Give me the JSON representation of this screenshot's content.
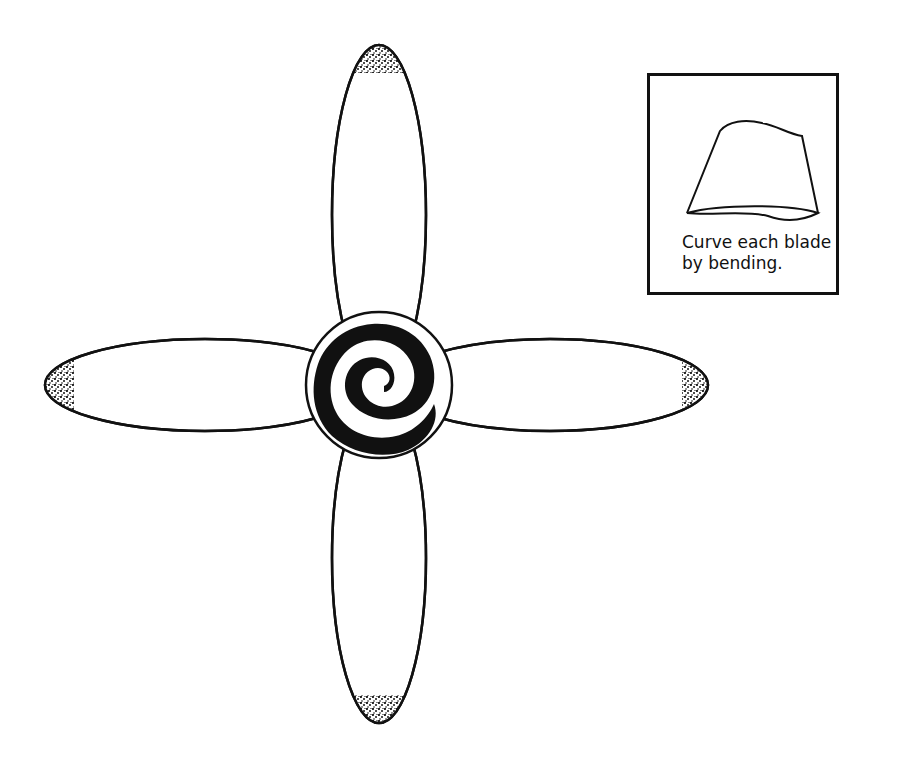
{
  "diagram": {
    "blades": [
      {
        "id": "top",
        "tip": "stippled"
      },
      {
        "id": "right",
        "tip": "stippled"
      },
      {
        "id": "bottom",
        "tip": "stippled"
      },
      {
        "id": "left",
        "tip": "stippled"
      }
    ],
    "hub": {
      "decoration": "black spiral"
    },
    "colors": {
      "line": "#111111",
      "background": "#ffffff"
    }
  },
  "inset": {
    "illustration": "curved blade",
    "caption_line1": "Curve each blade",
    "caption_line2": "by bending."
  }
}
